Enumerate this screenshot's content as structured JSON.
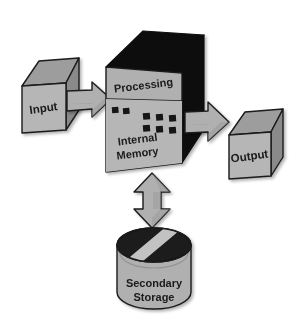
{
  "diagram": {
    "type": "block-diagram",
    "background_color": "#ffffff",
    "palette": {
      "face_light": "#b6b6b6",
      "face_mid": "#9d9d9d",
      "face_dark": "#8a8a8a",
      "black": "#0d0d0d",
      "arrow_fill": "#b0b0b0",
      "arrow_fill_shade": "#9a9a9a",
      "outline": "#1a1a1a",
      "text": "#1a1a1a",
      "disk_top": "#1a1a1a",
      "disk_stripe": "#c2c2c2"
    },
    "nodes": [
      {
        "id": "input",
        "label": "Input",
        "shape": "cube",
        "label_rotation_deg": -8
      },
      {
        "id": "processing",
        "label": "Processing",
        "shape": "box-3d-top-panel",
        "label_rotation_deg": -10
      },
      {
        "id": "internal-memory",
        "label_line1": "Internal",
        "label_line2": "Memory",
        "shape": "box-3d-bottom-panel",
        "label_rotation_deg": -8,
        "chips": {
          "left_group_count": 2,
          "right_group_rows": 2,
          "right_group_cols": 3,
          "total": 8,
          "color": "#141414"
        }
      },
      {
        "id": "output",
        "label": "Output",
        "shape": "cube",
        "label_rotation_deg": -8
      },
      {
        "id": "secondary-storage",
        "label_line1": "Secondary",
        "label_line2": "Storage",
        "shape": "cylinder"
      }
    ],
    "arrows": [
      {
        "id": "input-to-processing",
        "from": "input",
        "to": "processing",
        "direction": "right",
        "heads": 1
      },
      {
        "id": "processing-to-output",
        "from": "processing",
        "to": "output",
        "direction": "right",
        "heads": 1
      },
      {
        "id": "memory-to-storage",
        "from": "internal-memory",
        "to": "secondary-storage",
        "direction": "vertical",
        "heads": 2
      }
    ]
  }
}
